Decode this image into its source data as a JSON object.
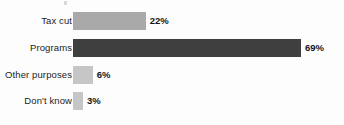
{
  "chart_data": {
    "type": "bar",
    "orientation": "horizontal",
    "title": "",
    "subtitle": "",
    "xlabel": "",
    "ylabel": "",
    "grid": false,
    "legend": false,
    "xlim": [
      0,
      100
    ],
    "value_suffix": "%",
    "categories": [
      "Tax cut",
      "Programs",
      "Other purposes",
      "Don't know"
    ],
    "values": [
      22,
      69,
      6,
      3
    ],
    "value_labels": [
      "22%",
      "69%",
      "6%",
      "3%"
    ],
    "bar_colors": [
      "#a9a9a9",
      "#3f3f3f",
      "#c6c6c6",
      "#c6c6c6"
    ],
    "bars": [
      {
        "category": "Tax cut",
        "value": 22,
        "value_label": "22%",
        "color": "#a9a9a9"
      },
      {
        "category": "Programs",
        "value": 69,
        "value_label": "69%",
        "color": "#3f3f3f"
      },
      {
        "category": "Other purposes",
        "value": 6,
        "value_label": "6%",
        "color": "#c6c6c6"
      },
      {
        "category": "Don't know",
        "value": 3,
        "value_label": "3%",
        "color": "#c6c6c6"
      }
    ]
  },
  "colors": {
    "background": "#fdfdfd",
    "label_text": "#1c1c1c",
    "value_text": "#161616",
    "bar_light": "#c6c6c6",
    "bar_medium": "#a9a9a9",
    "bar_dark": "#3f3f3f"
  }
}
